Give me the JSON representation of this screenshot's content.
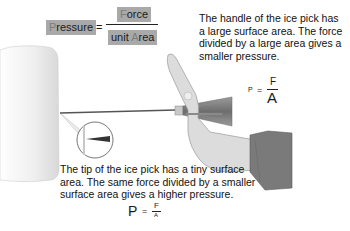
{
  "main_formula": {
    "lhs_first": "P",
    "lhs_rest": "ressure",
    "equals": "=",
    "numerator_first": "F",
    "numerator_rest": "orce",
    "denominator_prefix": "unit ",
    "denominator_first": "A",
    "denominator_rest": "rea"
  },
  "handle_caption": {
    "text": "The handle of the ice pick has a large surface area. The force divided by a large area gives a smaller pressure.",
    "formula": {
      "lhs": "P",
      "equals": "=",
      "numerator": "F",
      "denominator": "A"
    }
  },
  "tip_caption": {
    "text": "The tip of the ice pick has a tiny surface area. The same force divided by a smaller surface area gives a higher pressure.",
    "formula": {
      "lhs": "P",
      "equals": "=",
      "numerator": "F",
      "denominator": "A"
    }
  },
  "illustration": {
    "objects": [
      "ice-block",
      "ice-pick",
      "hand",
      "sleeve",
      "magnified-tip-inset"
    ],
    "colors": {
      "ice": "#f2f2f2",
      "hand": "#d9d9d9",
      "sleeve": "#7a7a7a",
      "pick_handle": "#8a8a8a",
      "formula_box": "#a9a9a9"
    }
  }
}
